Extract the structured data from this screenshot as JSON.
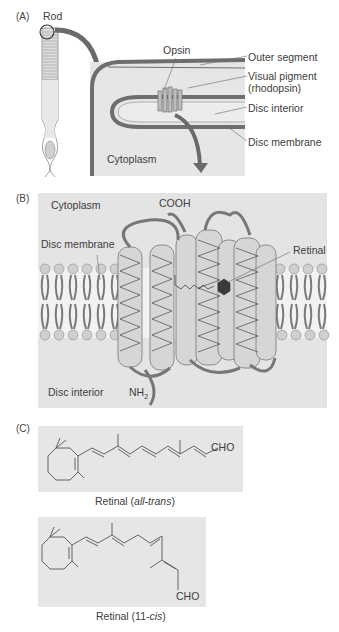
{
  "panels": {
    "a": {
      "letter": "(A)",
      "rod_label": "Rod",
      "opsin_label": "Opsin",
      "cytoplasm_label": "Cytoplasm",
      "callouts": {
        "outer_segment": "Outer segment",
        "visual_pigment": "Visual pigment",
        "visual_pigment_sub": "(rhodopsin)",
        "disc_interior": "Disc interior",
        "disc_membrane": "Disc membrane"
      }
    },
    "b": {
      "letter": "(B)",
      "cytoplasm_label": "Cytoplasm",
      "cooh_label": "COOH",
      "disc_membrane_label": "Disc membrane",
      "retinal_label": "Retinal",
      "disc_interior_label": "Disc interior",
      "nh2_label": "NH",
      "nh2_sub": "2"
    },
    "c": {
      "letter": "(C)",
      "all_trans": {
        "cho_label": "CHO",
        "caption_prefix": "Retinal (",
        "caption_italic": "all-trans",
        "caption_suffix": ")"
      },
      "eleven_cis": {
        "cho_label": "CHO",
        "caption_prefix": "Retinal (11-",
        "caption_italic": "cis",
        "caption_suffix": ")"
      }
    }
  },
  "colors": {
    "panel_bg": "#e6e6e6",
    "membrane_dark": "#6e6e6e",
    "arrow": "#6a6a6a",
    "retinal": "#3a3a3a"
  }
}
